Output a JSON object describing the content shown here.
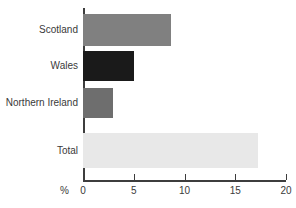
{
  "chart_data": {
    "type": "bar",
    "orientation": "horizontal",
    "title": "",
    "xlabel": "%",
    "ylabel": "",
    "xlim": [
      0,
      20
    ],
    "xticks": [
      0,
      5,
      10,
      15,
      20
    ],
    "xtick_labels": [
      "0",
      "5",
      "10",
      "15",
      "20"
    ],
    "grid": false,
    "legend": false,
    "categories": [
      "Scotland",
      "Wales",
      "Northern Ireland",
      "Total"
    ],
    "values": [
      8.7,
      5.0,
      3.0,
      17.2
    ],
    "bar_colors": [
      "#808080",
      "#1a1a1a",
      "#6e6e6e",
      "#e8e8e8"
    ],
    "series": [
      {
        "name": "",
        "values": [
          8.7,
          5.0,
          3.0,
          17.2
        ]
      }
    ],
    "points": [
      {
        "category": "Scotland",
        "value": 8.7,
        "color": "#808080",
        "top": 14,
        "height": 32
      },
      {
        "category": "Wales",
        "value": 5.0,
        "color": "#1a1a1a",
        "top": 51,
        "height": 30
      },
      {
        "category": "Northern Ireland",
        "value": 3.0,
        "color": "#6e6e6e",
        "top": 88,
        "height": 30
      },
      {
        "category": "Total",
        "value": 17.2,
        "color": "#e8e8e8",
        "top": 133,
        "height": 35
      }
    ],
    "axis_color": "#3d3d3d",
    "text_color": "#3a3a3a",
    "background": "#ffffff"
  }
}
